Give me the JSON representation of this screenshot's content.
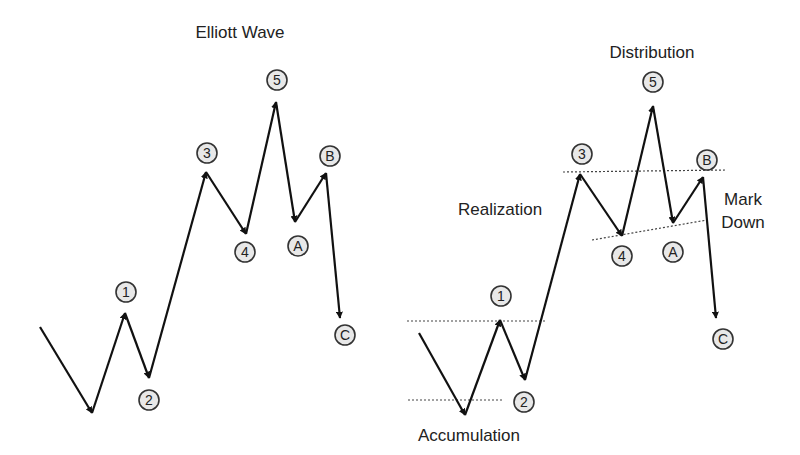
{
  "colors": {
    "background": "#ffffff",
    "line": "#111111",
    "label_circle_fill": "#e8e8e8",
    "label_circle_stroke": "#333333",
    "text": "#222222",
    "dotted_line": "#444444"
  },
  "left_diagram": {
    "title": "Elliott Wave",
    "title_pos": [
      240,
      38
    ],
    "path": [
      [
        40,
        327
      ],
      [
        92,
        413
      ],
      [
        125,
        313
      ],
      [
        149,
        378
      ],
      [
        206,
        172
      ],
      [
        246,
        234
      ],
      [
        276,
        102
      ],
      [
        295,
        222
      ],
      [
        326,
        173
      ],
      [
        340,
        318
      ]
    ],
    "labels": [
      {
        "text": "1",
        "x": 126,
        "y": 292
      },
      {
        "text": "2",
        "x": 149,
        "y": 400
      },
      {
        "text": "3",
        "x": 207,
        "y": 153
      },
      {
        "text": "4",
        "x": 245,
        "y": 252
      },
      {
        "text": "5",
        "x": 277,
        "y": 80
      },
      {
        "text": "A",
        "x": 298,
        "y": 246
      },
      {
        "text": "B",
        "x": 330,
        "y": 156
      },
      {
        "text": "C",
        "x": 345,
        "y": 335
      }
    ]
  },
  "right_diagram": {
    "path": [
      [
        419,
        333
      ],
      [
        465,
        415
      ],
      [
        500,
        320
      ],
      [
        525,
        380
      ],
      [
        580,
        174
      ],
      [
        622,
        236
      ],
      [
        653,
        106
      ],
      [
        673,
        223
      ],
      [
        703,
        177
      ],
      [
        716,
        318
      ]
    ],
    "labels": [
      {
        "text": "1",
        "x": 501,
        "y": 296
      },
      {
        "text": "2",
        "x": 524,
        "y": 402
      },
      {
        "text": "3",
        "x": 582,
        "y": 154
      },
      {
        "text": "4",
        "x": 622,
        "y": 256
      },
      {
        "text": "5",
        "x": 653,
        "y": 82
      },
      {
        "text": "A",
        "x": 673,
        "y": 252
      },
      {
        "text": "B",
        "x": 707,
        "y": 160
      },
      {
        "text": "C",
        "x": 723,
        "y": 339
      }
    ],
    "phase_labels": [
      {
        "text": "Distribution",
        "x": 652,
        "y": 58,
        "anchor": "middle"
      },
      {
        "text": "Realization",
        "x": 458,
        "y": 215,
        "anchor": "start"
      },
      {
        "text": "Mark",
        "x": 743,
        "y": 205,
        "anchor": "middle"
      },
      {
        "text": "Down",
        "x": 743,
        "y": 228,
        "anchor": "middle"
      },
      {
        "text": "Accumulation",
        "x": 469,
        "y": 441,
        "anchor": "middle"
      }
    ],
    "dotted_lines": [
      {
        "x1": 407,
        "y1": 321,
        "x2": 545,
        "y2": 321
      },
      {
        "x1": 408,
        "y1": 400,
        "x2": 503,
        "y2": 400
      },
      {
        "x1": 563,
        "y1": 172,
        "x2": 726,
        "y2": 170
      },
      {
        "x1": 592,
        "y1": 240,
        "x2": 707,
        "y2": 220
      }
    ]
  }
}
